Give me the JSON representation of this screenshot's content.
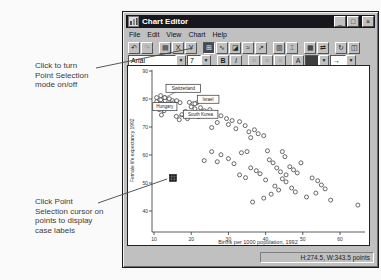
{
  "page": {
    "callout_top": "Click to turn\nPoint Selection\nmode on/off",
    "callout_bottom": "Click Point\nSelection cursor on\npoints to display\ncase labels"
  },
  "window": {
    "title": "Chart Editor",
    "icons": {
      "minimize": "_",
      "maximize": "□",
      "close": "×",
      "dropdown": "▼"
    },
    "menu": [
      "File",
      "Edit",
      "View",
      "Chart",
      "Help"
    ],
    "toolbar_main": [
      {
        "name": "undo-icon",
        "glyph": "↶"
      },
      {
        "name": "redo-icon",
        "glyph": "↷",
        "disabled": true
      },
      {
        "sep": true
      },
      {
        "name": "chart-options-icon",
        "glyph": "▤"
      },
      {
        "name": "x-axis-icon",
        "glyph": "X"
      },
      {
        "name": "y-axis-icon",
        "glyph": "Y"
      },
      {
        "sep": true
      },
      {
        "name": "point-selection-icon",
        "glyph": "⊞",
        "pressed": true
      },
      {
        "name": "line-chart-icon",
        "glyph": "∿"
      },
      {
        "name": "area-chart-icon",
        "glyph": "◪"
      },
      {
        "name": "interpolation-icon",
        "glyph": "≈"
      },
      {
        "name": "trend-icon",
        "glyph": "↗"
      },
      {
        "sep": true
      },
      {
        "name": "bar-chart-icon",
        "glyph": "▥"
      },
      {
        "name": "interval-icon",
        "glyph": "⌶"
      },
      {
        "sep": true
      },
      {
        "name": "grid-icon",
        "glyph": "▦"
      },
      {
        "name": "swap-axes-icon",
        "glyph": "⇄"
      },
      {
        "sep": true
      },
      {
        "name": "rotate-icon",
        "glyph": "↻"
      },
      {
        "name": "3d-icon",
        "glyph": "◫"
      }
    ],
    "toolbar_format": {
      "font_value": "Arial",
      "size_value": "7",
      "bold_label": "B",
      "italic_label": "I",
      "style_buttons": [
        {
          "name": "align-left-icon",
          "glyph": "≡"
        },
        {
          "name": "align-center-icon",
          "glyph": "≡"
        },
        {
          "name": "align-right-icon",
          "glyph": "≡"
        }
      ],
      "text_color_label": "A",
      "line_style_glyph": "→"
    },
    "status_right": "H:274.5, W:343.5 points"
  },
  "chart_data": {
    "type": "scatter",
    "title": "",
    "xlabel": "Births per 1000 population, 1992",
    "ylabel": "Female life expectancy 1992",
    "x_ticks": [
      10,
      20,
      30,
      40,
      50,
      60
    ],
    "y_ticks": [
      90,
      80,
      70,
      60,
      50,
      40
    ],
    "xlim": [
      7,
      66
    ],
    "ylim": [
      33,
      92
    ],
    "grid": false,
    "legend": "none",
    "points": [
      [
        10.7,
        80.5
      ],
      [
        11.8,
        81.2
      ],
      [
        12.9,
        80.5
      ],
      [
        10.7,
        79.0
      ],
      [
        11.8,
        79.7
      ],
      [
        13.0,
        79.4
      ],
      [
        14.1,
        80.1
      ],
      [
        15.0,
        79.4
      ],
      [
        11.8,
        78.3
      ],
      [
        13.0,
        78.0
      ],
      [
        14.1,
        78.3
      ],
      [
        15.2,
        78.6
      ],
      [
        10.9,
        77.6
      ],
      [
        12.2,
        77.3
      ],
      [
        13.4,
        77.6
      ],
      [
        16.1,
        79.4
      ],
      [
        17.0,
        78.7
      ],
      [
        14.5,
        76.9
      ],
      [
        11.4,
        76.2
      ],
      [
        12.7,
        75.8
      ],
      [
        19.5,
        78.8
      ],
      [
        20.5,
        78.3
      ],
      [
        21.5,
        78.6
      ],
      [
        20.0,
        77.2
      ],
      [
        21.0,
        76.5
      ],
      [
        22.5,
        76.9
      ],
      [
        18.5,
        75.5
      ],
      [
        23.5,
        75.8
      ],
      [
        25.0,
        76.2
      ],
      [
        24.0,
        74.8
      ],
      [
        26.5,
        75.1
      ],
      [
        22.0,
        73.7
      ],
      [
        19.0,
        73.0
      ],
      [
        17.5,
        74.4
      ],
      [
        16.8,
        72.6
      ],
      [
        28.0,
        74.0
      ],
      [
        29.5,
        73.0
      ],
      [
        31.0,
        72.3
      ],
      [
        27.0,
        71.6
      ],
      [
        30.0,
        70.9
      ],
      [
        33.0,
        71.9
      ],
      [
        34.5,
        70.5
      ],
      [
        32.0,
        69.4
      ],
      [
        25.5,
        69.8
      ],
      [
        35.5,
        68.3
      ],
      [
        37.0,
        69.0
      ],
      [
        38.0,
        67.6
      ],
      [
        36.0,
        66.2
      ],
      [
        39.5,
        66.9
      ],
      [
        25.5,
        61.2
      ],
      [
        28.0,
        60.1
      ],
      [
        33.5,
        60.8
      ],
      [
        35.0,
        61.2
      ],
      [
        40.5,
        61.5
      ],
      [
        44.5,
        61.2
      ],
      [
        45.2,
        59.4
      ],
      [
        41.0,
        58.3
      ],
      [
        42.0,
        57.2
      ],
      [
        30.0,
        58.7
      ],
      [
        31.5,
        56.9
      ],
      [
        27.0,
        57.6
      ],
      [
        23.5,
        58.0
      ],
      [
        36.0,
        55.4
      ],
      [
        37.5,
        54.4
      ],
      [
        49.5,
        57.2
      ],
      [
        38.5,
        53.3
      ],
      [
        33.0,
        52.9
      ],
      [
        34.6,
        51.9
      ],
      [
        40.0,
        51.1
      ],
      [
        43.0,
        55.4
      ],
      [
        44.0,
        54.0
      ],
      [
        45.5,
        52.9
      ],
      [
        46.5,
        55.8
      ],
      [
        47.5,
        54.7
      ],
      [
        48.5,
        53.6
      ],
      [
        44.5,
        51.5
      ],
      [
        45.5,
        50.4
      ],
      [
        42.5,
        48.9
      ],
      [
        43.5,
        47.5
      ],
      [
        41.5,
        46.0
      ],
      [
        39.5,
        44.6
      ],
      [
        47.0,
        48.2
      ],
      [
        48.0,
        46.8
      ],
      [
        52.5,
        51.8
      ],
      [
        54.0,
        50.8
      ],
      [
        55.0,
        49.3
      ],
      [
        56.0,
        47.9
      ],
      [
        53.5,
        46.4
      ],
      [
        51.0,
        45.0
      ],
      [
        57.5,
        43.9
      ],
      [
        36.5,
        43.2
      ],
      [
        64.8,
        42.1
      ]
    ],
    "labeled_points": [
      {
        "label": "Switzerland",
        "x": 12.9,
        "y": 80.5,
        "box_dx": 1.2,
        "box_dy": -13.3
      },
      {
        "label": "Israel",
        "x": 21.0,
        "y": 78.3,
        "box_dx": 2.4,
        "box_dy": -8.5
      },
      {
        "label": "Hungary",
        "x": 12.0,
        "y": 74.3,
        "box_dx": -8.7,
        "box_dy": -12.3
      },
      {
        "label": "South Korea",
        "x": 16.0,
        "y": 73.8,
        "box_dx": 7.0,
        "box_dy": -6.1
      }
    ],
    "selected_point": {
      "x": 15.1,
      "y": 51.8
    }
  }
}
